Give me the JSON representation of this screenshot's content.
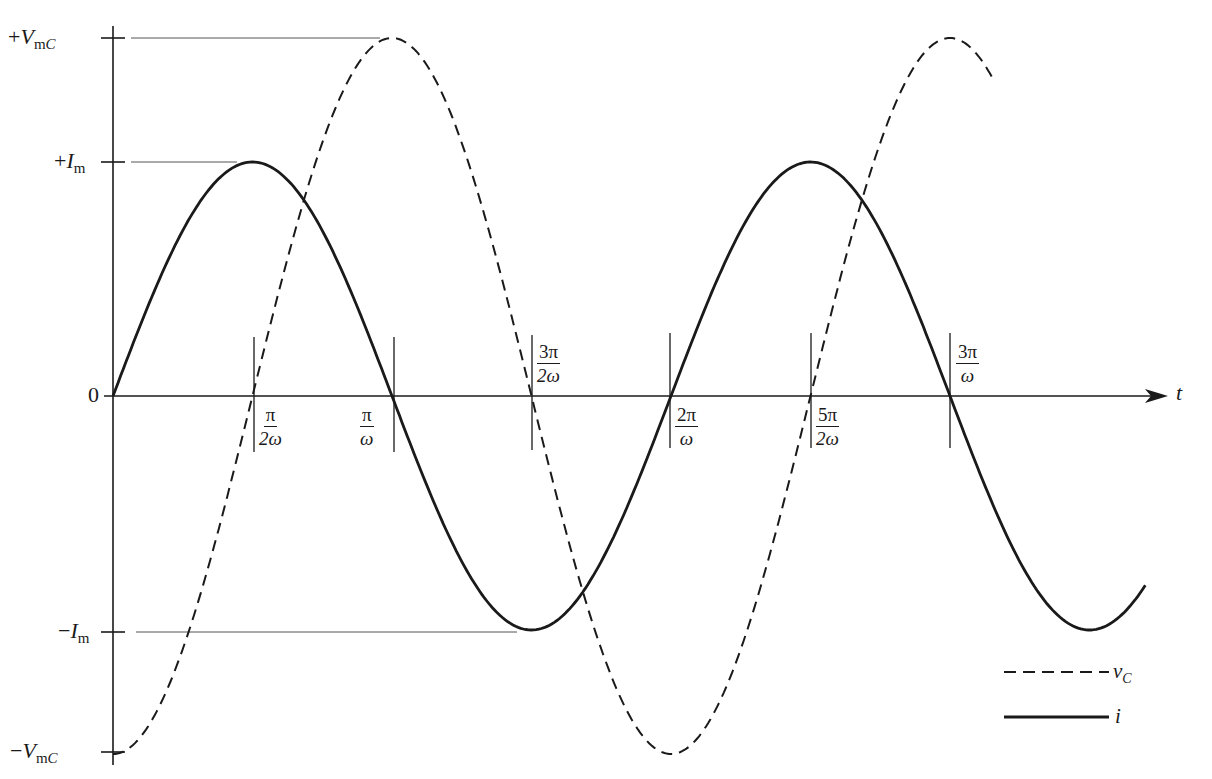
{
  "chart_data": {
    "type": "line",
    "title": "",
    "xlabel": "t",
    "ylabel": "",
    "grid": false,
    "legend_position": "bottom-right",
    "x_ticks": [
      {
        "value": "π/(2ω)",
        "num": "π",
        "den": "2ω"
      },
      {
        "value": "π/ω",
        "num": "π",
        "den": "ω"
      },
      {
        "value": "3π/(2ω)",
        "num": "3π",
        "den": "2ω"
      },
      {
        "value": "2π/ω",
        "num": "2π",
        "den": "ω"
      },
      {
        "value": "5π/(2ω)",
        "num": "5π",
        "den": "2ω"
      },
      {
        "value": "3π/ω",
        "num": "3π",
        "den": "ω"
      }
    ],
    "y_ticks": [
      "+V_mC",
      "+I_m",
      "0",
      "−I_m",
      "−V_mC"
    ],
    "x_range_in_quarter_periods": [
      0,
      7.4
    ],
    "series": [
      {
        "name": "v_C",
        "style": "dashed",
        "formula": "-V_mC cos(ωt)",
        "amplitude_label": "V_mC",
        "x_quarter_periods": [
          0,
          1,
          2,
          3,
          4,
          5,
          6,
          6.3
        ],
        "values_normalized": [
          -1,
          0,
          1,
          0,
          -1,
          0,
          1,
          0.81
        ]
      },
      {
        "name": "i",
        "style": "solid",
        "formula": "I_m sin(ωt)",
        "amplitude_label": "I_m",
        "x_quarter_periods": [
          0,
          1,
          2,
          3,
          4,
          5,
          6,
          7,
          7.4
        ],
        "values_normalized": [
          0,
          1,
          0,
          -1,
          0,
          1,
          0,
          -1,
          -0.81
        ]
      }
    ],
    "relative_amplitude": {
      "V_mC_over_I_m": 1.53
    },
    "annotations": [
      "i leads v_C by π/2 (a quarter period)"
    ]
  },
  "axis": {
    "t_label": "t",
    "zero_label": "0",
    "y_labels": {
      "pos_v": {
        "sign": "+",
        "sym": "V",
        "sub_m": "m",
        "sub_c": "C"
      },
      "pos_i": {
        "sign": "+",
        "sym": "I",
        "sub_m": "m"
      },
      "neg_i": {
        "sign": "−",
        "sym": "I",
        "sub_m": "m"
      },
      "neg_v": {
        "sign": "−",
        "sym": "V",
        "sub_m": "m",
        "sub_c": "C"
      }
    }
  },
  "ticks": [
    {
      "num": "π",
      "den": "2ω"
    },
    {
      "num": "π",
      "den": "ω"
    },
    {
      "num": "3π",
      "den": "2ω"
    },
    {
      "num": "2π",
      "den": "ω"
    },
    {
      "num": "5π",
      "den": "2ω"
    },
    {
      "num": "3π",
      "den": "ω"
    }
  ],
  "legend": {
    "vc": {
      "sym": "v",
      "sub": "C"
    },
    "i": {
      "sym": "i"
    }
  },
  "colors": {
    "ink": "#1a1a1a",
    "guide": "#555555",
    "background": "#ffffff"
  }
}
